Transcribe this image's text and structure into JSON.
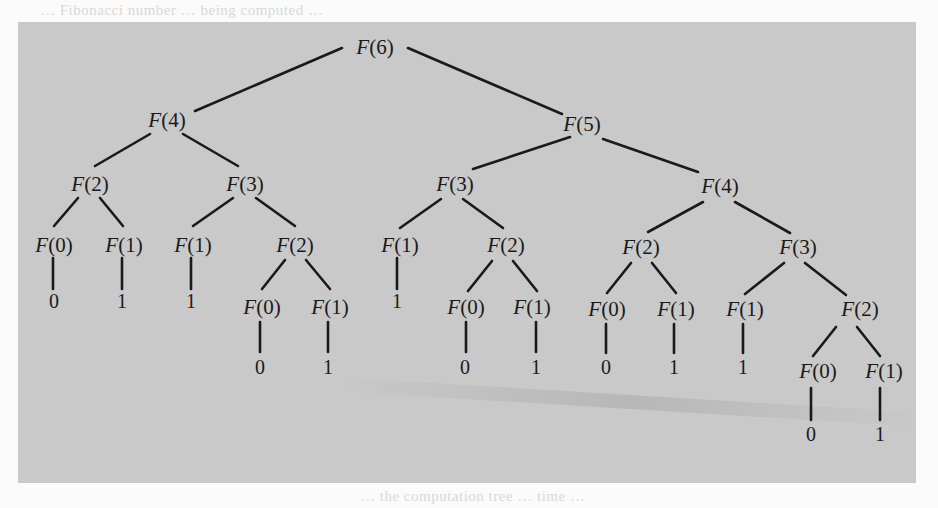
{
  "figure": {
    "background_color": "#c9c9c9",
    "ink_color": "#1a1a1a",
    "page_color": "#fbfbfb",
    "bleed_text_top": "… Fibonacci number … being computed …",
    "bleed_text_bottom": "… the computation tree … time … "
  },
  "nodes": [
    {
      "id": "n0",
      "label": "F(6)",
      "fn": "F",
      "arg": "(6)",
      "x": 375,
      "y": 47
    },
    {
      "id": "n1",
      "label": "F(4)",
      "fn": "F",
      "arg": "(4)",
      "x": 167,
      "y": 120
    },
    {
      "id": "n2",
      "label": "F(5)",
      "fn": "F",
      "arg": "(5)",
      "x": 582,
      "y": 124
    },
    {
      "id": "n3",
      "label": "F(2)",
      "fn": "F",
      "arg": "(2)",
      "x": 90,
      "y": 184
    },
    {
      "id": "n4",
      "label": "F(3)",
      "fn": "F",
      "arg": "(3)",
      "x": 245,
      "y": 184
    },
    {
      "id": "n5",
      "label": "F(3)",
      "fn": "F",
      "arg": "(3)",
      "x": 455,
      "y": 184
    },
    {
      "id": "n6",
      "label": "F(4)",
      "fn": "F",
      "arg": "(4)",
      "x": 720,
      "y": 186
    },
    {
      "id": "n7",
      "label": "F(0)",
      "fn": "F",
      "arg": "(0)",
      "x": 54,
      "y": 245
    },
    {
      "id": "n8",
      "label": "F(1)",
      "fn": "F",
      "arg": "(1)",
      "x": 124,
      "y": 245
    },
    {
      "id": "n9",
      "label": "F(1)",
      "fn": "F",
      "arg": "(1)",
      "x": 193,
      "y": 245
    },
    {
      "id": "n10",
      "label": "F(2)",
      "fn": "F",
      "arg": "(2)",
      "x": 295,
      "y": 245
    },
    {
      "id": "n11",
      "label": "F(1)",
      "fn": "F",
      "arg": "(1)",
      "x": 400,
      "y": 245
    },
    {
      "id": "n12",
      "label": "F(2)",
      "fn": "F",
      "arg": "(2)",
      "x": 506,
      "y": 245
    },
    {
      "id": "n13",
      "label": "F(2)",
      "fn": "F",
      "arg": "(2)",
      "x": 641,
      "y": 247
    },
    {
      "id": "n14",
      "label": "F(3)",
      "fn": "F",
      "arg": "(3)",
      "x": 798,
      "y": 247
    },
    {
      "id": "n15",
      "label": "F(0)",
      "fn": "F",
      "arg": "(0)",
      "x": 262,
      "y": 307
    },
    {
      "id": "n16",
      "label": "F(1)",
      "fn": "F",
      "arg": "(1)",
      "x": 330,
      "y": 307
    },
    {
      "id": "n17",
      "label": "F(0)",
      "fn": "F",
      "arg": "(0)",
      "x": 466,
      "y": 307
    },
    {
      "id": "n18",
      "label": "F(1)",
      "fn": "F",
      "arg": "(1)",
      "x": 532,
      "y": 307
    },
    {
      "id": "n19",
      "label": "F(0)",
      "fn": "F",
      "arg": "(0)",
      "x": 607,
      "y": 309
    },
    {
      "id": "n20",
      "label": "F(1)",
      "fn": "F",
      "arg": "(1)",
      "x": 676,
      "y": 309
    },
    {
      "id": "n21",
      "label": "F(1)",
      "fn": "F",
      "arg": "(1)",
      "x": 745,
      "y": 309
    },
    {
      "id": "n22",
      "label": "F(2)",
      "fn": "F",
      "arg": "(2)",
      "x": 860,
      "y": 309
    },
    {
      "id": "n23",
      "label": "F(0)",
      "fn": "F",
      "arg": "(0)",
      "x": 818,
      "y": 371
    },
    {
      "id": "n24",
      "label": "F(1)",
      "fn": "F",
      "arg": "(1)",
      "x": 884,
      "y": 371
    }
  ],
  "leaves": [
    {
      "id": "v7",
      "value": "0",
      "x": 54,
      "y": 301,
      "parent": "n7"
    },
    {
      "id": "v8",
      "value": "1",
      "x": 122,
      "y": 301,
      "parent": "n8"
    },
    {
      "id": "v9",
      "value": "1",
      "x": 191,
      "y": 301,
      "parent": "n9"
    },
    {
      "id": "v11",
      "value": "1",
      "x": 397,
      "y": 301,
      "parent": "n11"
    },
    {
      "id": "v15",
      "value": "0",
      "x": 260,
      "y": 367,
      "parent": "n15"
    },
    {
      "id": "v16",
      "value": "1",
      "x": 328,
      "y": 367,
      "parent": "n16"
    },
    {
      "id": "v17",
      "value": "0",
      "x": 465,
      "y": 367,
      "parent": "n17"
    },
    {
      "id": "v18",
      "value": "1",
      "x": 536,
      "y": 367,
      "parent": "n18"
    },
    {
      "id": "v19",
      "value": "0",
      "x": 606,
      "y": 367,
      "parent": "n19"
    },
    {
      "id": "v20",
      "value": "1",
      "x": 674,
      "y": 367,
      "parent": "n20"
    },
    {
      "id": "v21",
      "value": "1",
      "x": 743,
      "y": 367,
      "parent": "n21"
    },
    {
      "id": "v23",
      "value": "0",
      "x": 811,
      "y": 434,
      "parent": "n23"
    },
    {
      "id": "v24",
      "value": "1",
      "x": 880,
      "y": 434,
      "parent": "n24"
    }
  ],
  "edges": [
    {
      "from": "n0",
      "to": "n1",
      "x1": 342,
      "y1": 48,
      "x2": 195,
      "y2": 111
    },
    {
      "from": "n0",
      "to": "n2",
      "x1": 408,
      "y1": 48,
      "x2": 562,
      "y2": 114
    },
    {
      "from": "n1",
      "to": "n3",
      "x1": 150,
      "y1": 134,
      "x2": 95,
      "y2": 166
    },
    {
      "from": "n1",
      "to": "n4",
      "x1": 183,
      "y1": 134,
      "x2": 238,
      "y2": 166
    },
    {
      "from": "n2",
      "to": "n5",
      "x1": 570,
      "y1": 137,
      "x2": 473,
      "y2": 169
    },
    {
      "from": "n2",
      "to": "n6",
      "x1": 603,
      "y1": 139,
      "x2": 698,
      "y2": 172
    },
    {
      "from": "n3",
      "to": "n7",
      "x1": 78,
      "y1": 198,
      "x2": 54,
      "y2": 226
    },
    {
      "from": "n3",
      "to": "n8",
      "x1": 100,
      "y1": 198,
      "x2": 123,
      "y2": 226
    },
    {
      "from": "n4",
      "to": "n9",
      "x1": 233,
      "y1": 198,
      "x2": 193,
      "y2": 226
    },
    {
      "from": "n4",
      "to": "n10",
      "x1": 256,
      "y1": 198,
      "x2": 295,
      "y2": 226
    },
    {
      "from": "n5",
      "to": "n11",
      "x1": 441,
      "y1": 199,
      "x2": 400,
      "y2": 228
    },
    {
      "from": "n5",
      "to": "n12",
      "x1": 463,
      "y1": 199,
      "x2": 503,
      "y2": 228
    },
    {
      "from": "n6",
      "to": "n13",
      "x1": 703,
      "y1": 202,
      "x2": 648,
      "y2": 232
    },
    {
      "from": "n6",
      "to": "n14",
      "x1": 735,
      "y1": 202,
      "x2": 790,
      "y2": 233
    },
    {
      "from": "n7",
      "to": "v7",
      "x1": 53,
      "y1": 258,
      "x2": 53,
      "y2": 289
    },
    {
      "from": "n8",
      "to": "v8",
      "x1": 122,
      "y1": 258,
      "x2": 122,
      "y2": 289
    },
    {
      "from": "n9",
      "to": "v9",
      "x1": 191,
      "y1": 258,
      "x2": 191,
      "y2": 289
    },
    {
      "from": "n10",
      "to": "n15",
      "x1": 285,
      "y1": 260,
      "x2": 262,
      "y2": 289
    },
    {
      "from": "n10",
      "to": "n16",
      "x1": 306,
      "y1": 260,
      "x2": 330,
      "y2": 289
    },
    {
      "from": "n11",
      "to": "v11",
      "x1": 397,
      "y1": 258,
      "x2": 397,
      "y2": 289
    },
    {
      "from": "n12",
      "to": "n17",
      "x1": 492,
      "y1": 261,
      "x2": 468,
      "y2": 291
    },
    {
      "from": "n12",
      "to": "n18",
      "x1": 513,
      "y1": 261,
      "x2": 537,
      "y2": 291
    },
    {
      "from": "n13",
      "to": "n19",
      "x1": 631,
      "y1": 263,
      "x2": 607,
      "y2": 293
    },
    {
      "from": "n13",
      "to": "n20",
      "x1": 652,
      "y1": 263,
      "x2": 676,
      "y2": 293
    },
    {
      "from": "n14",
      "to": "n21",
      "x1": 784,
      "y1": 263,
      "x2": 745,
      "y2": 294
    },
    {
      "from": "n14",
      "to": "n22",
      "x1": 805,
      "y1": 263,
      "x2": 846,
      "y2": 295
    },
    {
      "from": "n15",
      "to": "v15",
      "x1": 260,
      "y1": 322,
      "x2": 260,
      "y2": 352
    },
    {
      "from": "n16",
      "to": "v16",
      "x1": 328,
      "y1": 322,
      "x2": 328,
      "y2": 352
    },
    {
      "from": "n17",
      "to": "v17",
      "x1": 466,
      "y1": 322,
      "x2": 466,
      "y2": 352
    },
    {
      "from": "n18",
      "to": "v18",
      "x1": 536,
      "y1": 322,
      "x2": 536,
      "y2": 352
    },
    {
      "from": "n19",
      "to": "v19",
      "x1": 606,
      "y1": 324,
      "x2": 606,
      "y2": 353
    },
    {
      "from": "n20",
      "to": "v20",
      "x1": 674,
      "y1": 324,
      "x2": 674,
      "y2": 353
    },
    {
      "from": "n21",
      "to": "v21",
      "x1": 743,
      "y1": 324,
      "x2": 743,
      "y2": 353
    },
    {
      "from": "n22",
      "to": "n23",
      "x1": 836,
      "y1": 327,
      "x2": 813,
      "y2": 356
    },
    {
      "from": "n22",
      "to": "n24",
      "x1": 857,
      "y1": 327,
      "x2": 880,
      "y2": 356
    },
    {
      "from": "n23",
      "to": "v23",
      "x1": 811,
      "y1": 388,
      "x2": 811,
      "y2": 420
    },
    {
      "from": "n24",
      "to": "v24",
      "x1": 880,
      "y1": 388,
      "x2": 880,
      "y2": 420
    }
  ]
}
